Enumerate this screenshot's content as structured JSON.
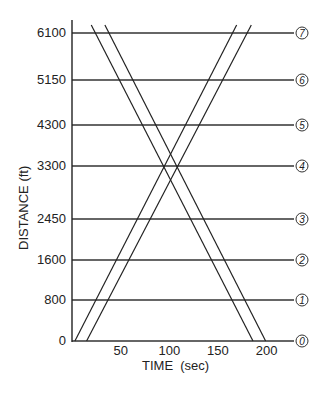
{
  "chart_data": {
    "type": "line",
    "title": "",
    "xlabel": "TIME  (sec)",
    "ylabel": "DISTANCE (ft)",
    "xlim": [
      0,
      230
    ],
    "x_ticks": [
      50,
      100,
      150,
      200
    ],
    "y_tick_labels": [
      "0",
      "800",
      "1600",
      "2450",
      "3300",
      "4300",
      "5150",
      "6100"
    ],
    "stations": [
      {
        "id": "0",
        "distance": 0
      },
      {
        "id": "1",
        "distance": 800
      },
      {
        "id": "2",
        "distance": 1600
      },
      {
        "id": "3",
        "distance": 2450
      },
      {
        "id": "4",
        "distance": 3300
      },
      {
        "id": "5",
        "distance": 4300
      },
      {
        "id": "6",
        "distance": 5150
      },
      {
        "id": "7",
        "distance": 6100
      }
    ],
    "grid": "horizontal lines at each station",
    "series": [
      {
        "name": "Ascending band lower edge",
        "direction": "up",
        "points": [
          [
            3,
            0
          ],
          [
            165,
            6100
          ]
        ]
      },
      {
        "name": "Ascending band upper edge",
        "direction": "up",
        "points": [
          [
            15,
            0
          ],
          [
            180,
            6100
          ]
        ]
      },
      {
        "name": "Descending band lower edge",
        "direction": "down",
        "points": [
          [
            24,
            6100
          ],
          [
            186,
            0
          ]
        ]
      },
      {
        "name": "Descending band upper edge",
        "direction": "down",
        "points": [
          [
            38,
            6100
          ],
          [
            199,
            0
          ]
        ]
      }
    ]
  },
  "layout": {
    "axis_x0_px": 72,
    "px_per_sec": 0.973,
    "station_y_px": [
      341,
      300,
      260,
      219,
      166,
      125,
      80,
      33
    ],
    "line_end_px": 294,
    "circle_x_px": 302
  },
  "labels": {
    "x_title": "TIME  (sec)",
    "y_title": "DISTANCE (ft)"
  }
}
